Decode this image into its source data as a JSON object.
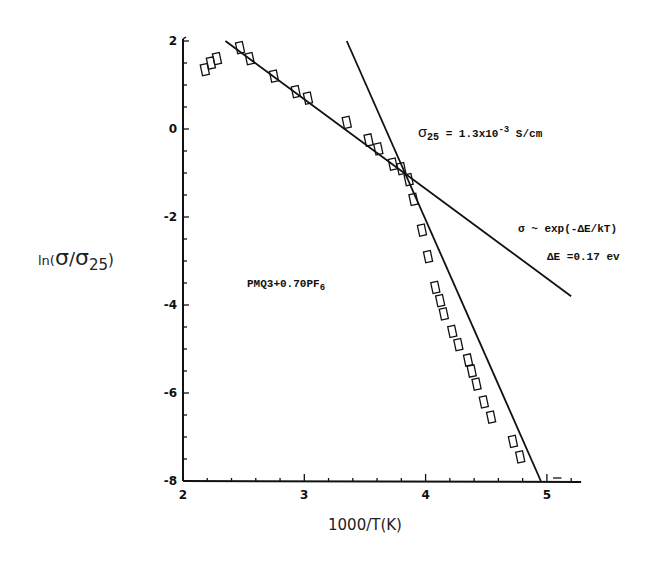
{
  "chart_data": {
    "type": "scatter",
    "title": "",
    "xlabel": "1000/T(K)",
    "ylabel": "ln(σ/σ25)",
    "xlim": [
      2,
      5.2
    ],
    "ylim": [
      -8,
      2
    ],
    "x_ticks": [
      2,
      3,
      4,
      5
    ],
    "x_tick_labels": [
      "2",
      "3",
      "4",
      "5"
    ],
    "y_ticks": [
      2,
      0,
      -2,
      -4,
      -6,
      -8
    ],
    "y_tick_labels": [
      "2",
      "0",
      "-2",
      "-4",
      "-6",
      "-8"
    ],
    "grid": false,
    "legend": null,
    "marker": "open-rectangle",
    "series": [
      {
        "name": "PMQ3+0.70PF6",
        "points": [
          [
            2.18,
            1.35
          ],
          [
            2.23,
            1.5
          ],
          [
            2.28,
            1.6
          ],
          [
            2.47,
            1.85
          ],
          [
            2.55,
            1.6
          ],
          [
            2.75,
            1.2
          ],
          [
            2.93,
            0.85
          ],
          [
            3.03,
            0.7
          ],
          [
            3.35,
            0.15
          ],
          [
            3.53,
            -0.25
          ],
          [
            3.61,
            -0.45
          ],
          [
            3.73,
            -0.8
          ],
          [
            3.8,
            -0.9
          ],
          [
            3.86,
            -1.15
          ],
          [
            3.9,
            -1.6
          ],
          [
            3.97,
            -2.3
          ],
          [
            4.02,
            -2.9
          ],
          [
            4.08,
            -3.6
          ],
          [
            4.12,
            -3.9
          ],
          [
            4.15,
            -4.2
          ],
          [
            4.22,
            -4.6
          ],
          [
            4.27,
            -4.9
          ],
          [
            4.35,
            -5.25
          ],
          [
            4.38,
            -5.5
          ],
          [
            4.42,
            -5.8
          ],
          [
            4.48,
            -6.2
          ],
          [
            4.54,
            -6.55
          ],
          [
            4.72,
            -7.1
          ],
          [
            4.78,
            -7.45
          ]
        ]
      }
    ],
    "fit_lines": [
      {
        "name": "high-temperature fit",
        "from": [
          2.35,
          2.0
        ],
        "to": [
          5.2,
          -3.8
        ]
      },
      {
        "name": "low-temperature fit",
        "from": [
          3.35,
          2.0
        ],
        "to": [
          4.95,
          -8.0
        ]
      }
    ],
    "annotations": [
      {
        "text": "σ25 = 1.3x10^-3 S/cm",
        "x": 3.55,
        "y": 0.2
      },
      {
        "text": "σ ~ exp(-ΔE/kT)",
        "x": 4.45,
        "y": -1.7
      },
      {
        "text": "ΔE = 0.17 ev",
        "x": 4.5,
        "y": -2.5
      },
      {
        "text": "PMQ3+0.70PF6",
        "x": 2.4,
        "y": -3.5
      }
    ]
  },
  "labels": {
    "xlabel": "1000/T(K)",
    "ylabel_prefix": "ln(",
    "ylabel_sigma": "σ",
    "ylabel_slash": "/",
    "ylabel_sigma2": "σ",
    "ylabel_sub": "25",
    "ylabel_suffix": ")",
    "sigma25_prefix": "σ",
    "sigma25_sub": "25",
    "sigma25_value": " = 1.3x10",
    "sigma25_exp": "-3",
    "sigma25_unit": " S/cm",
    "formula": "σ ~ exp(-ΔE/kT)",
    "delta_e": "ΔE =0.17 ev",
    "sample_prefix": "PMQ3+0.70PF",
    "sample_sub": "6"
  }
}
